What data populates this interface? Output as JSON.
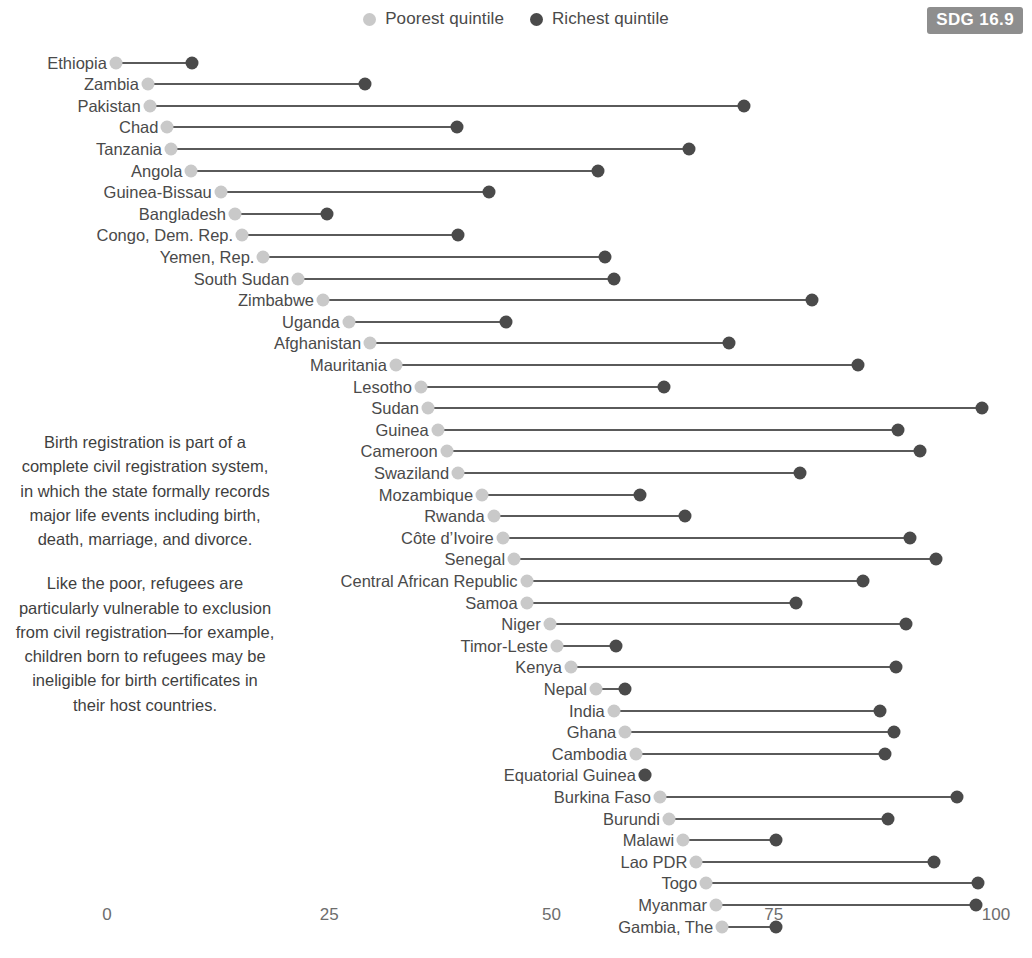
{
  "legend": {
    "items": [
      {
        "label": "Poorest quintile",
        "color": "#c9c9c9",
        "icon": "circle-icon"
      },
      {
        "label": "Richest quintile",
        "color": "#4a4a4a",
        "icon": "circle-icon"
      }
    ]
  },
  "badge": {
    "text": "SDG 16.9",
    "background": "#8e8e8e",
    "color": "#ffffff"
  },
  "narrative": {
    "paragraph1": "Birth registration is part of a complete civil registration system, in which the state formally records major life events including birth, death, marriage, and divorce.",
    "paragraph2": "Like the poor, refugees are particularly vulnerable to exclusion from civil registration—for example, children born to refugees may be ineligible for birth certificates in their host countries."
  },
  "axis": {
    "ticks": [
      "0",
      "25",
      "50",
      "75",
      "100"
    ],
    "values": [
      0,
      25,
      50,
      75,
      100
    ]
  },
  "chart_data": {
    "type": "dumbbell",
    "title": "",
    "xlabel": "",
    "ylabel": "",
    "xlim": [
      0,
      100
    ],
    "grid": false,
    "legend_position": "top-center",
    "series": [
      {
        "name": "Poorest quintile",
        "color": "#c9c9c9"
      },
      {
        "name": "Richest quintile",
        "color": "#4a4a4a"
      }
    ],
    "categories": [
      "Ethiopia",
      "Zambia",
      "Pakistan",
      "Chad",
      "Tanzania",
      "Angola",
      "Guinea-Bissau",
      "Bangladesh",
      "Congo, Dem. Rep.",
      "Yemen, Rep.",
      "South Sudan",
      "Zimbabwe",
      "Uganda",
      "Afghanistan",
      "Mauritania",
      "Lesotho",
      "Sudan",
      "Guinea",
      "Cameroon",
      "Swaziland",
      "Mozambique",
      "Rwanda",
      "Côte d’Ivoire",
      "Senegal",
      "Central African Republic",
      "Samoa",
      "Niger",
      "Timor-Leste",
      "Kenya",
      "Nepal",
      "India",
      "Ghana",
      "Cambodia",
      "Equatorial Guinea",
      "Burkina Faso",
      "Burundi",
      "Malawi",
      "Lao PDR",
      "Togo",
      "Myanmar",
      "Gambia, The"
    ],
    "poorest": [
      1.0,
      4.6,
      4.8,
      6.8,
      7.2,
      9.5,
      12.8,
      14.4,
      15.2,
      17.6,
      21.5,
      24.3,
      27.2,
      29.6,
      32.5,
      35.3,
      36.1,
      37.2,
      38.2,
      39.5,
      42.2,
      43.5,
      44.5,
      45.8,
      47.2,
      47.2,
      49.8,
      50.6,
      52.2,
      55.0,
      57.0,
      58.3,
      59.5,
      60.5,
      62.2,
      63.2,
      64.8,
      66.3,
      67.4,
      68.5,
      69.2
    ],
    "richest": [
      9.6,
      29.0,
      71.7,
      39.4,
      65.5,
      55.2,
      43.0,
      24.8,
      39.5,
      56.0,
      57.0,
      79.3,
      44.9,
      70.0,
      84.5,
      62.7,
      98.4,
      89.0,
      91.5,
      78.0,
      60.0,
      65.0,
      90.3,
      93.3,
      85.0,
      77.5,
      89.9,
      57.2,
      88.8,
      58.3,
      87.0,
      88.5,
      87.5,
      60.5,
      95.6,
      87.8,
      75.2,
      93.0,
      98.0,
      97.8,
      75.3
    ]
  }
}
